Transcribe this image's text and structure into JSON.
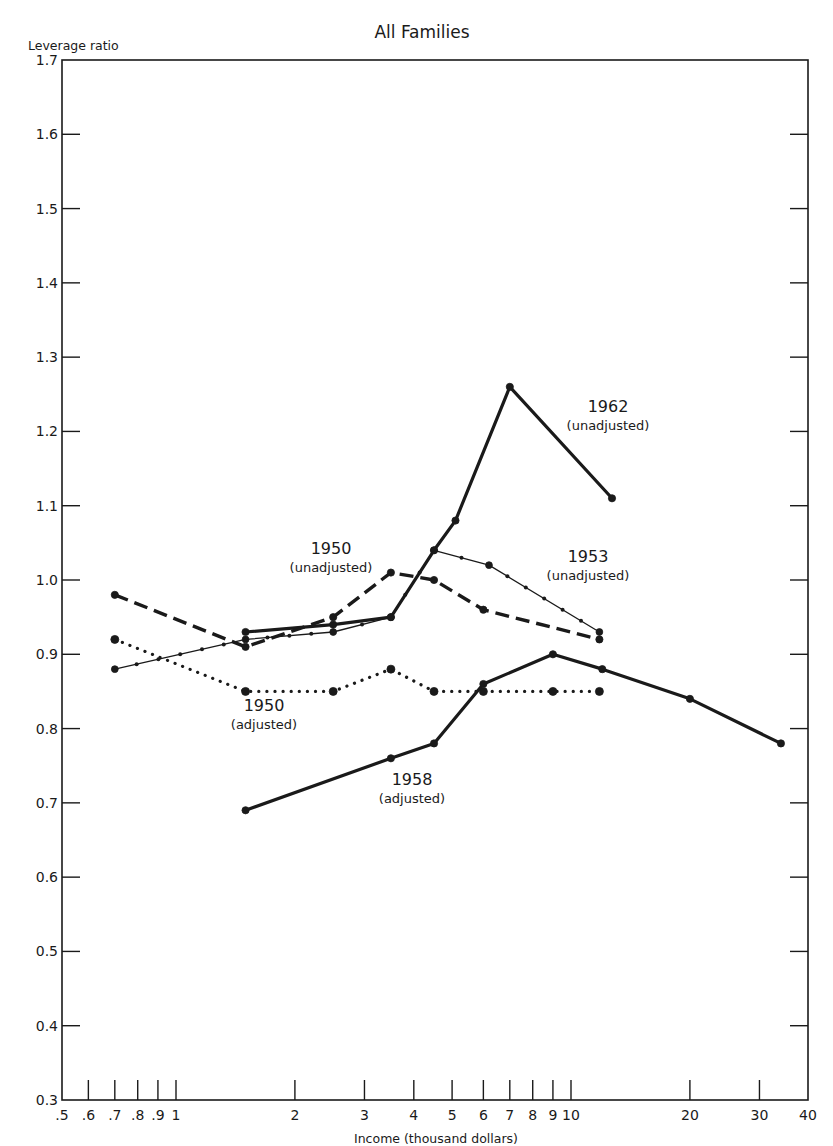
{
  "chart_data": {
    "type": "line",
    "title": "All Families",
    "xlabel": "Income (thousand dollars)",
    "ylabel": "Leverage ratio",
    "xscale": "log",
    "xlim": [
      0.5,
      40
    ],
    "ylim": [
      0.3,
      1.7
    ],
    "grid": false,
    "legend": "inline annotations",
    "x_ticks": [
      0.5,
      0.6,
      0.7,
      0.8,
      0.9,
      1,
      2,
      3,
      4,
      5,
      6,
      7,
      8,
      9,
      10,
      20,
      30,
      40
    ],
    "x_tick_labels": [
      ".5",
      ".6",
      ".7",
      ".8",
      ".9",
      "1",
      "2",
      "3",
      "4",
      "5",
      "6",
      "7",
      "8",
      "9",
      "10",
      "20",
      "30",
      "40"
    ],
    "y_ticks": [
      0.3,
      0.4,
      0.5,
      0.6,
      0.7,
      0.8,
      0.9,
      1.0,
      1.1,
      1.2,
      1.3,
      1.4,
      1.5,
      1.6,
      1.7
    ],
    "y_tick_labels": [
      "0.3",
      "0.4",
      "0.5",
      "0.6",
      "0.7",
      "0.8",
      "0.9",
      "1.0",
      "1.1",
      "1.2",
      "1.3",
      "1.4",
      "1.5",
      "1.6",
      "1.7"
    ],
    "series": [
      {
        "name": "1962 (unadjusted)",
        "style": "solid-heavy",
        "x": [
          1.5,
          2.5,
          3.5,
          4.5,
          5.1,
          7,
          12.7
        ],
        "y": [
          0.93,
          0.94,
          0.95,
          1.04,
          1.08,
          1.26,
          1.11
        ]
      },
      {
        "name": "1953 (unadjusted)",
        "style": "solid-thin-dotted-markers",
        "x": [
          0.7,
          1.5,
          2.5,
          3.5,
          4.5,
          6.2,
          11.8
        ],
        "y": [
          0.88,
          0.92,
          0.93,
          0.95,
          1.04,
          1.02,
          0.93
        ]
      },
      {
        "name": "1950 (unadjusted)",
        "style": "dashed",
        "x": [
          0.7,
          1.5,
          2.5,
          3.5,
          4.5,
          6,
          11.8
        ],
        "y": [
          0.98,
          0.91,
          0.95,
          1.01,
          1.0,
          0.96,
          0.92
        ]
      },
      {
        "name": "1950 (adjusted)",
        "style": "dotted",
        "x": [
          0.7,
          1.5,
          2.5,
          3.5,
          4.5,
          6,
          9,
          11.8
        ],
        "y": [
          0.92,
          0.85,
          0.85,
          0.88,
          0.85,
          0.85,
          0.85,
          0.85
        ]
      },
      {
        "name": "1958 (adjusted)",
        "style": "solid-heavy",
        "x": [
          1.5,
          3.5,
          4.5,
          6,
          9,
          12,
          20,
          34
        ],
        "y": [
          0.69,
          0.76,
          0.78,
          0.86,
          0.9,
          0.88,
          0.84,
          0.78
        ]
      }
    ],
    "annotations": [
      {
        "year": "1962",
        "sub": "(unadjusted)",
        "x": 608,
        "y": 412
      },
      {
        "year": "1953",
        "sub": "(unadjusted)",
        "x": 588,
        "y": 562
      },
      {
        "year": "1950",
        "sub": "(unadjusted)",
        "x": 331,
        "y": 554
      },
      {
        "year": "1950",
        "sub": "(adjusted)",
        "x": 264,
        "y": 711
      },
      {
        "year": "1958",
        "sub": "(adjusted)",
        "x": 412,
        "y": 785
      }
    ]
  },
  "labels": {
    "title": "All Families",
    "ylabel": "Leverage ratio",
    "xlabel": "Income (thousand dollars)"
  }
}
